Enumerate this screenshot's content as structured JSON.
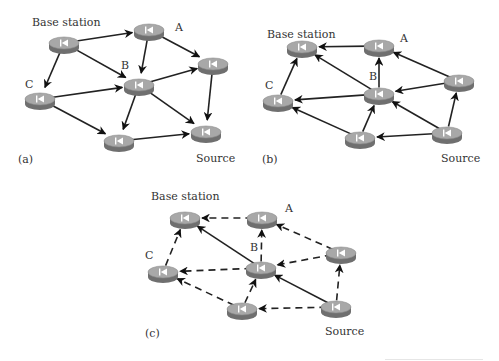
{
  "colors": {
    "background": "#ffffff",
    "edge": "#222222",
    "node_top": "#a8a8a8",
    "node_side": "#6f6f6f",
    "node_rim": "#8c8c8c",
    "node_icon": "#ffffff",
    "text": "#333333"
  },
  "node_icon": "router-icon",
  "panels": [
    {
      "id": "a",
      "caption": "(a)",
      "caption_pos": [
        18,
        154
      ],
      "labels": [
        {
          "text": "Base station",
          "x": 32,
          "y": 17
        },
        {
          "text": "A",
          "x": 175,
          "y": 22
        },
        {
          "text": "B",
          "x": 121,
          "y": 60
        },
        {
          "text": "C",
          "x": 25,
          "y": 79
        },
        {
          "text": "Source",
          "x": 196,
          "y": 153
        }
      ],
      "nodes": [
        {
          "id": "base",
          "x": 64,
          "y": 43
        },
        {
          "id": "A",
          "x": 149,
          "y": 30
        },
        {
          "id": "R",
          "x": 213,
          "y": 64
        },
        {
          "id": "B",
          "x": 139,
          "y": 85
        },
        {
          "id": "C",
          "x": 40,
          "y": 99
        },
        {
          "id": "D",
          "x": 119,
          "y": 141
        },
        {
          "id": "src",
          "x": 206,
          "y": 132
        }
      ],
      "edges": [
        {
          "from": "base",
          "to": "A",
          "style": "solid"
        },
        {
          "from": "base",
          "to": "B",
          "style": "solid"
        },
        {
          "from": "base",
          "to": "C",
          "style": "solid"
        },
        {
          "from": "A",
          "to": "B",
          "style": "solid"
        },
        {
          "from": "A",
          "to": "R",
          "style": "solid"
        },
        {
          "from": "C",
          "to": "B",
          "style": "solid"
        },
        {
          "from": "C",
          "to": "D",
          "style": "solid"
        },
        {
          "from": "B",
          "to": "R",
          "style": "solid"
        },
        {
          "from": "B",
          "to": "D",
          "style": "solid"
        },
        {
          "from": "B",
          "to": "src",
          "style": "solid"
        },
        {
          "from": "R",
          "to": "src",
          "style": "solid"
        },
        {
          "from": "D",
          "to": "src",
          "style": "solid"
        }
      ]
    },
    {
      "id": "b",
      "caption": "(b)",
      "caption_pos": [
        262,
        154
      ],
      "labels": [
        {
          "text": "Base station",
          "x": 267,
          "y": 29
        },
        {
          "text": "A",
          "x": 400,
          "y": 33
        },
        {
          "text": "B",
          "x": 369,
          "y": 71
        },
        {
          "text": "C",
          "x": 265,
          "y": 80
        },
        {
          "text": "Source",
          "x": 441,
          "y": 153
        }
      ],
      "nodes": [
        {
          "id": "base",
          "x": 302,
          "y": 47
        },
        {
          "id": "A",
          "x": 379,
          "y": 46
        },
        {
          "id": "R",
          "x": 459,
          "y": 81
        },
        {
          "id": "B",
          "x": 379,
          "y": 94
        },
        {
          "id": "C",
          "x": 278,
          "y": 101
        },
        {
          "id": "D",
          "x": 360,
          "y": 138
        },
        {
          "id": "src",
          "x": 447,
          "y": 133
        }
      ],
      "edges": [
        {
          "from": "A",
          "to": "base",
          "style": "solid"
        },
        {
          "from": "B",
          "to": "base",
          "style": "solid"
        },
        {
          "from": "C",
          "to": "base",
          "style": "solid"
        },
        {
          "from": "B",
          "to": "A",
          "style": "solid"
        },
        {
          "from": "R",
          "to": "A",
          "style": "solid"
        },
        {
          "from": "R",
          "to": "B",
          "style": "solid"
        },
        {
          "from": "B",
          "to": "C",
          "style": "solid"
        },
        {
          "from": "D",
          "to": "C",
          "style": "solid"
        },
        {
          "from": "D",
          "to": "B",
          "style": "solid"
        },
        {
          "from": "src",
          "to": "B",
          "style": "solid"
        },
        {
          "from": "src",
          "to": "R",
          "style": "solid"
        },
        {
          "from": "src",
          "to": "D",
          "style": "solid"
        }
      ]
    },
    {
      "id": "c",
      "caption": "(c)",
      "caption_pos": [
        145,
        328
      ],
      "labels": [
        {
          "text": "Base station",
          "x": 151,
          "y": 191
        },
        {
          "text": "A",
          "x": 285,
          "y": 203
        },
        {
          "text": "B",
          "x": 250,
          "y": 242
        },
        {
          "text": "C",
          "x": 145,
          "y": 250
        },
        {
          "text": "Source",
          "x": 325,
          "y": 326
        }
      ],
      "nodes": [
        {
          "id": "base",
          "x": 185,
          "y": 218
        },
        {
          "id": "A",
          "x": 262,
          "y": 218
        },
        {
          "id": "R",
          "x": 341,
          "y": 253
        },
        {
          "id": "B",
          "x": 261,
          "y": 268
        },
        {
          "id": "C",
          "x": 163,
          "y": 272
        },
        {
          "id": "D",
          "x": 242,
          "y": 309
        },
        {
          "id": "src",
          "x": 336,
          "y": 307
        }
      ],
      "edges": [
        {
          "from": "A",
          "to": "base",
          "style": "dashed"
        },
        {
          "from": "B",
          "to": "base",
          "style": "solid"
        },
        {
          "from": "C",
          "to": "base",
          "style": "dashed"
        },
        {
          "from": "B",
          "to": "A",
          "style": "dashed"
        },
        {
          "from": "R",
          "to": "A",
          "style": "dashed"
        },
        {
          "from": "R",
          "to": "B",
          "style": "dashed"
        },
        {
          "from": "B",
          "to": "C",
          "style": "dashed"
        },
        {
          "from": "D",
          "to": "C",
          "style": "dashed"
        },
        {
          "from": "D",
          "to": "B",
          "style": "dashed"
        },
        {
          "from": "src",
          "to": "B",
          "style": "solid"
        },
        {
          "from": "src",
          "to": "R",
          "style": "dashed"
        },
        {
          "from": "src",
          "to": "D",
          "style": "dashed"
        }
      ]
    }
  ]
}
